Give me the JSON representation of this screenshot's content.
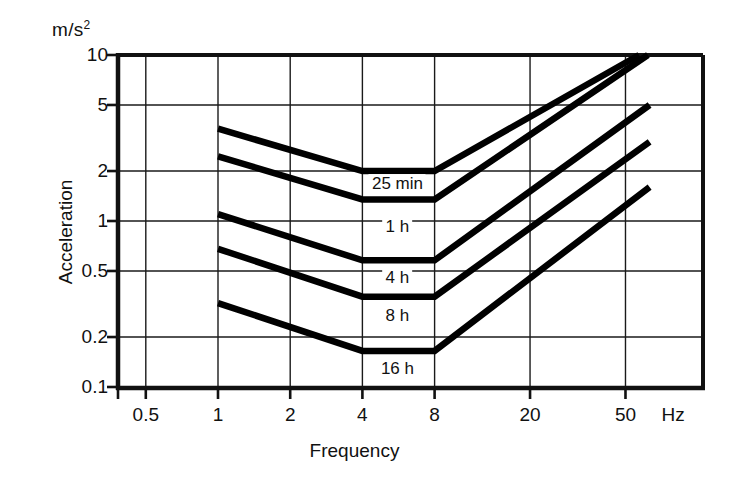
{
  "chart_data": {
    "type": "line",
    "title": "",
    "xlabel": "Frequency",
    "ylabel": "Acceleration",
    "unit_caption": "m/s",
    "unit_exponent": "2",
    "x_unit": "Hz",
    "xscale": "log",
    "yscale": "log",
    "xlim": [
      0.4,
      63
    ],
    "ylim": [
      0.1,
      10
    ],
    "xticks": [
      "0.5",
      "1",
      "2",
      "4",
      "8",
      "20",
      "50"
    ],
    "xtick_values": [
      0.5,
      1,
      2,
      4,
      8,
      20,
      50
    ],
    "yticks": [
      "10",
      "5",
      "2",
      "1",
      "0.5",
      "0.2",
      "0.1"
    ],
    "ytick_values": [
      10,
      5,
      2,
      1,
      0.5,
      0.2,
      0.1
    ],
    "grid": true,
    "legend": "inline-labels",
    "series": [
      {
        "name": "25 min",
        "label": "25 min",
        "x": [
          1,
          4,
          8,
          57
        ],
        "y": [
          3.6,
          2.0,
          2.0,
          10.0
        ]
      },
      {
        "name": "1 h",
        "label": "1 h",
        "x": [
          1,
          4,
          8,
          62
        ],
        "y": [
          2.45,
          1.35,
          1.35,
          10.0
        ]
      },
      {
        "name": "4 h",
        "label": "4 h",
        "x": [
          1,
          4,
          8,
          63
        ],
        "y": [
          1.1,
          0.58,
          0.58,
          5.0
        ]
      },
      {
        "name": "8 h",
        "label": "8 h",
        "x": [
          1,
          4,
          8,
          63
        ],
        "y": [
          0.68,
          0.35,
          0.35,
          3.0
        ]
      },
      {
        "name": "16 h",
        "label": "16 h",
        "x": [
          1,
          4,
          8,
          63
        ],
        "y": [
          0.32,
          0.165,
          0.165,
          1.6
        ]
      }
    ],
    "curve_labels": [
      {
        "text": "25 min",
        "x": 5.6,
        "y": 1.68
      },
      {
        "text": "1 h",
        "x": 5.6,
        "y": 0.92
      },
      {
        "text": "4 h",
        "x": 5.6,
        "y": 0.455
      },
      {
        "text": "8 h",
        "x": 5.6,
        "y": 0.268
      },
      {
        "text": "16 h",
        "x": 5.6,
        "y": 0.128
      }
    ]
  }
}
